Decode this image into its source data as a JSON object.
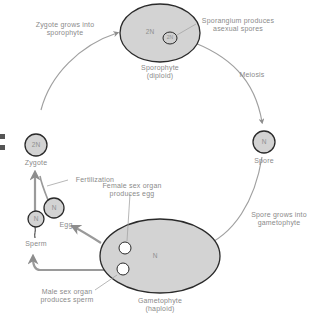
{
  "colors": {
    "cell_fill": "#d3d3d3",
    "cell_stroke": "#2a2a2a",
    "arrow": "#9a9a9a",
    "text": "#8a8a8a"
  },
  "stages": {
    "sporophyte": {
      "ploidy": "2N",
      "name": "Sporophyte",
      "sub": "(diploid)"
    },
    "spore": {
      "ploidy": "N",
      "name": "Spore"
    },
    "gametophyte": {
      "ploidy": "N",
      "name": "Gametophyte",
      "sub": "(haploid)"
    },
    "zygote": {
      "ploidy": "2N",
      "name": "Zygote"
    },
    "egg": {
      "ploidy": "N",
      "name": "Egg"
    },
    "sperm": {
      "ploidy": "N",
      "name": "Sperm"
    },
    "sporangium": {
      "ploidy": "2N"
    }
  },
  "annotations": {
    "zygote_grows": [
      "Zygote grows into",
      "sporophyte"
    ],
    "sporangium": [
      "Sporangium produces",
      "asexual spores"
    ],
    "meiosis": "Meiosis",
    "spore_grows": [
      "Spore grows into",
      "gametophyte"
    ],
    "fertilization": "Fertilization",
    "female_organ": [
      "Female sex organ",
      "produces egg"
    ],
    "male_organ": [
      "Male sex organ",
      "produces sperm"
    ]
  }
}
